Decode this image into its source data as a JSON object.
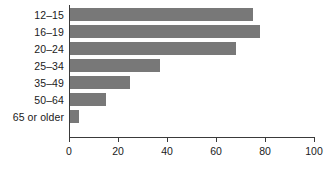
{
  "chart_data": {
    "type": "bar",
    "orientation": "horizontal",
    "title": "",
    "subtitle": "",
    "xlabel": "",
    "ylabel": "",
    "categories": [
      "12–15",
      "16–19",
      "20–24",
      "25–34",
      "35–49",
      "50–64",
      "65 or older"
    ],
    "values": [
      75,
      78,
      68,
      37,
      25,
      15,
      4
    ],
    "series": [
      {
        "name": "",
        "values": [
          75,
          78,
          68,
          37,
          25,
          15,
          4
        ]
      }
    ],
    "xlim": [
      0,
      100
    ],
    "xticks": [
      0,
      20,
      40,
      60,
      80,
      100
    ],
    "xtick_labels": [
      "0",
      "20",
      "40",
      "60",
      "80",
      "100"
    ],
    "grid": false,
    "legend": false,
    "legend_position": "none",
    "bar_color": "#787878",
    "axis_color": "#3a3a3a",
    "text_color": "#1a1a1a",
    "background": "#ffffff"
  }
}
